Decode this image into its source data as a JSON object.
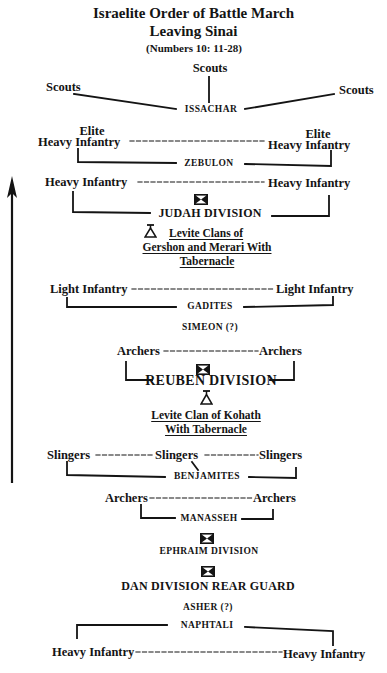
{
  "title": {
    "line1": "Israelite Order of Battle March",
    "line2": "Leaving Sinai",
    "reference": "(Numbers 10: 11-28)"
  },
  "direction_arrow": "up-arrow",
  "formations": {
    "issachar": {
      "scouts_center": "Scouts",
      "scouts_left": "Scouts",
      "scouts_right": "Scouts",
      "tribe": "ISSACHAR"
    },
    "zebulon": {
      "left_line1": "Elite",
      "left_line2": "Heavy Infantry",
      "right_line1": "Elite",
      "right_line2": "Heavy Infantry",
      "tribe": "ZEBULON"
    },
    "judah": {
      "left": "Heavy Infantry",
      "right": "Heavy Infantry",
      "icon": "division-standard-icon",
      "division": "JUDAH DIVISION"
    },
    "levites_gershon_merari": {
      "icon": "tabernacle-icon",
      "line1": "Levite Clans of",
      "line2": "Gershon and Merari With",
      "line3": "Tabernacle"
    },
    "gadites": {
      "left": "Light Infantry",
      "right": "Light Infantry",
      "tribe": "GADITES"
    },
    "simeon": {
      "tribe": "SIMEON (?)"
    },
    "reuben": {
      "left": "Archers",
      "right": "Archers",
      "icon": "division-standard-icon",
      "division": "REUBEN DIVISION"
    },
    "levites_kohath": {
      "icon": "tabernacle-icon",
      "line1": "Levite Clan of Kohath",
      "line2": "With Tabernacle"
    },
    "benjamites": {
      "left": "Slingers",
      "center": "Slingers",
      "right": "Slingers",
      "tribe": "BENJAMITES"
    },
    "manasseh": {
      "left": "Archers",
      "right": "Archers",
      "tribe": "MANASSEH"
    },
    "ephraim": {
      "icon": "division-standard-icon",
      "division": "EPHRAIM DIVISION"
    },
    "dan": {
      "icon": "division-standard-icon",
      "division": "DAN DIVISION REAR GUARD"
    },
    "asher": {
      "tribe": "ASHER (?)"
    },
    "naphtali": {
      "tribe": "NAPHTALI",
      "left": "Heavy Infantry",
      "right": "Heavy Infantry"
    }
  },
  "colors": {
    "ink": "#141414",
    "paper": "#ffffff"
  }
}
